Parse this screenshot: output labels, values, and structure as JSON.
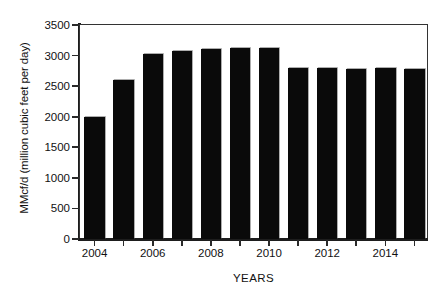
{
  "chart_data": {
    "type": "bar",
    "title": "",
    "subtitle": "",
    "xlabel": "YEARS",
    "ylabel": "MMcf/d (million cubic feet per day)",
    "categories": [
      2004,
      2005,
      2006,
      2007,
      2008,
      2009,
      2010,
      2011,
      2012,
      2013,
      2014,
      2015
    ],
    "values": [
      2000,
      2600,
      3020,
      3080,
      3100,
      3120,
      3120,
      2790,
      2790,
      2780,
      2790,
      2780
    ],
    "series": [
      {
        "name": "MMcf/d",
        "values": [
          2000,
          2600,
          3020,
          3080,
          3100,
          3120,
          3120,
          2790,
          2790,
          2780,
          2790,
          2780
        ]
      }
    ],
    "ylim": [
      0,
      3500
    ],
    "xlim": [
      2003.5,
      2015.5
    ],
    "y_ticks": [
      0,
      500,
      1000,
      1500,
      2000,
      2500,
      3000,
      3500
    ],
    "y_tick_labels": [
      "0",
      "500",
      "1000",
      "1500",
      "2000",
      "2500",
      "3000",
      "3500"
    ],
    "x_ticks": [
      2004,
      2006,
      2008,
      2010,
      2012,
      2014
    ],
    "x_tick_labels": [
      "2004",
      "2006",
      "2008",
      "2010",
      "2012",
      "2014"
    ],
    "grid": false,
    "legend": null,
    "bar_color": "#0a0a0a",
    "background_color": "#ffffff",
    "axis_color": "#1d1d1d"
  }
}
